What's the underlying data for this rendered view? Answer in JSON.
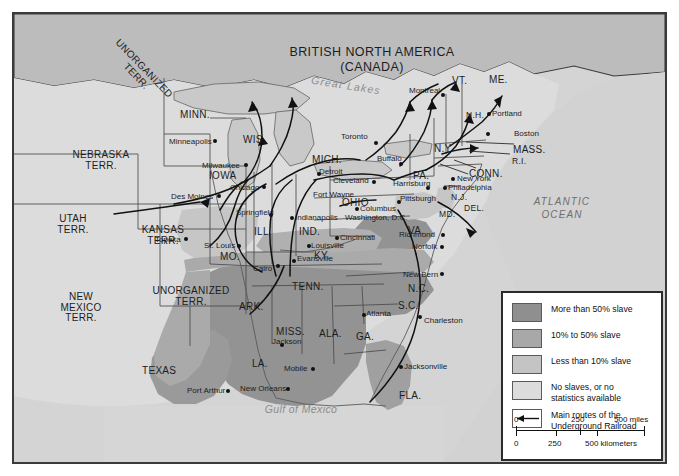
{
  "map": {
    "title": [
      "BRITISH NORTH AMERICA",
      "(CANADA)"
    ],
    "water_labels": {
      "great_lakes": "Great Lakes",
      "gulf": "Gulf of Mexico",
      "atlantic": [
        "ATLANTIC",
        "OCEAN"
      ]
    },
    "territories": [
      {
        "name": "UNORGANIZED\nTERR.",
        "rotated": true
      },
      {
        "name": "NEBRASKA\nTERR."
      },
      {
        "name": "UTAH\nTERR."
      },
      {
        "name": "KANSAS\nTERR."
      },
      {
        "name": "NEW\nMEXICO\nTERR."
      },
      {
        "name": "UNORGANIZED\nTERR."
      }
    ],
    "states": [
      {
        "label": "MINN."
      },
      {
        "label": "WIS."
      },
      {
        "label": "IOWA"
      },
      {
        "label": "MICH."
      },
      {
        "label": "OHIO"
      },
      {
        "label": "ILL."
      },
      {
        "label": "IND."
      },
      {
        "label": "MO."
      },
      {
        "label": "KY."
      },
      {
        "label": "TENN."
      },
      {
        "label": "ARK."
      },
      {
        "label": "MISS."
      },
      {
        "label": "ALA."
      },
      {
        "label": "GA."
      },
      {
        "label": "LA."
      },
      {
        "label": "TEXAS"
      },
      {
        "label": "FLA."
      },
      {
        "label": "S.C."
      },
      {
        "label": "N.C."
      },
      {
        "label": "VA."
      },
      {
        "label": "MD."
      },
      {
        "label": "DEL."
      },
      {
        "label": "N.J."
      },
      {
        "label": "PA."
      },
      {
        "label": "N.Y."
      },
      {
        "label": "VT."
      },
      {
        "label": "ME."
      },
      {
        "label": "N.H."
      },
      {
        "label": "MASS."
      },
      {
        "label": "R.I."
      },
      {
        "label": "CONN."
      }
    ],
    "cities": [
      {
        "name": "Minneapolis"
      },
      {
        "name": "Milwaukee"
      },
      {
        "name": "Des Moines"
      },
      {
        "name": "Chicago"
      },
      {
        "name": "Detroit"
      },
      {
        "name": "Toronto"
      },
      {
        "name": "Montreal"
      },
      {
        "name": "Portland"
      },
      {
        "name": "Boston"
      },
      {
        "name": "Buffalo"
      },
      {
        "name": "Cleveland"
      },
      {
        "name": "New York"
      },
      {
        "name": "Philadelphia"
      },
      {
        "name": "Harrisburg"
      },
      {
        "name": "Pittsburgh"
      },
      {
        "name": "Columbus"
      },
      {
        "name": "Washington, D.C."
      },
      {
        "name": "Richmond"
      },
      {
        "name": "Norfolk"
      },
      {
        "name": "New Bern"
      },
      {
        "name": "Charleston"
      },
      {
        "name": "Atlanta"
      },
      {
        "name": "Jacksonville"
      },
      {
        "name": "Mobile"
      },
      {
        "name": "New Orleans"
      },
      {
        "name": "Port Arthur"
      },
      {
        "name": "Jackson"
      },
      {
        "name": "Cairo"
      },
      {
        "name": "Evansville"
      },
      {
        "name": "Louisville"
      },
      {
        "name": "Cincinnati"
      },
      {
        "name": "Indianapolis"
      },
      {
        "name": "Fort Wayne"
      },
      {
        "name": "Springfield"
      },
      {
        "name": "St. Louis"
      },
      {
        "name": "Topeka"
      }
    ]
  },
  "legend": {
    "entries": [
      {
        "label": "More than 50% slave",
        "color": "#8f8f8f"
      },
      {
        "label": "10% to 50% slave",
        "color": "#a8a8a8"
      },
      {
        "label": "Less than 10% slave",
        "color": "#c4c4c4"
      },
      {
        "label": "No slaves, or no\nstatistics available",
        "color": "#dcdcdc"
      },
      {
        "label": "Main routes of the\nUnderground Railroad",
        "color": "#ffffff"
      }
    ],
    "scale": {
      "miles": [
        "0",
        "250",
        "500 miles"
      ],
      "kilometers": [
        "0",
        "250",
        "500 kilometers"
      ]
    }
  },
  "colors": {
    "frame": "#3a3a3a",
    "ocean": "#d2d2d2",
    "canada": "#bdbdbd",
    "lake": "#c9c9c9"
  }
}
